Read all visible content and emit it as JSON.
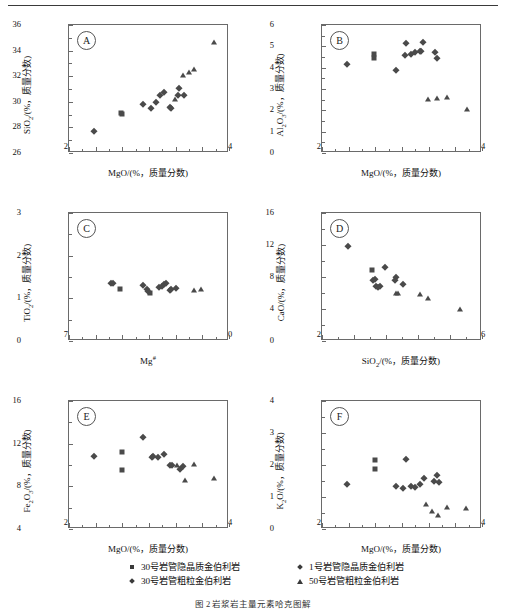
{
  "figure": {
    "caption": "图 2  岩浆岩主量元素哈克图解",
    "panels_order": [
      "A",
      "B",
      "C",
      "D",
      "E",
      "F"
    ]
  },
  "legend": {
    "items": [
      {
        "marker": "square",
        "label": "30号岩管隐晶质金伯利岩"
      },
      {
        "marker": "diamond",
        "label": "30号岩管粗粒金伯利岩"
      },
      {
        "marker": "diamond",
        "label": "1号岩管隐晶质金伯利岩"
      },
      {
        "marker": "triangle",
        "label": "50号岩管粗粒金伯利岩"
      }
    ]
  },
  "chart_data": [
    {
      "id": "A",
      "type": "scatter",
      "title": "A",
      "xlabel": "MgO/(%，质量分数)",
      "ylabel": "SiO2/(%，质量分数)",
      "xlim": [
        22,
        34
      ],
      "ylim": [
        26,
        36
      ],
      "xticks": [
        22,
        24,
        26,
        28,
        30,
        32,
        34
      ],
      "yticks": [
        26,
        28,
        30,
        32,
        34,
        36
      ],
      "grid": false,
      "series": [
        {
          "name": "30号岩管隐晶质金伯利岩",
          "marker": "square",
          "points": [
            [
              25.9,
              29.15
            ],
            [
              25.95,
              29.05
            ]
          ]
        },
        {
          "name": "30号岩管粗粒金伯利岩",
          "marker": "diamond",
          "points": [
            [
              23.9,
              27.75
            ],
            [
              27.55,
              29.85
            ],
            [
              28.15,
              29.55
            ],
            [
              28.5,
              29.95
            ],
            [
              28.8,
              30.5
            ],
            [
              29.1,
              30.8
            ],
            [
              29.6,
              29.6
            ],
            [
              29.65,
              29.5
            ],
            [
              30.2,
              30.55
            ],
            [
              30.25,
              31.05
            ],
            [
              30.65,
              30.5
            ]
          ]
        },
        {
          "name": "50号岩管粗粒金伯利岩",
          "marker": "triangle",
          "points": [
            [
              29.95,
              30.25
            ],
            [
              30.55,
              32.1
            ],
            [
              31.0,
              32.35
            ],
            [
              31.4,
              32.6
            ],
            [
              32.85,
              34.65
            ]
          ]
        }
      ]
    },
    {
      "id": "B",
      "type": "scatter",
      "title": "B",
      "xlabel": "MgO/(%，质量分数)",
      "ylabel": "Al2O3/(%，质量分数)",
      "xlim": [
        22,
        34
      ],
      "ylim": [
        0,
        6
      ],
      "xticks": [
        22,
        24,
        26,
        28,
        30,
        32,
        34
      ],
      "yticks": [
        0,
        1,
        2,
        3,
        4,
        5,
        6
      ],
      "grid": false,
      "series": [
        {
          "name": "30号岩管隐晶质金伯利岩",
          "marker": "square",
          "points": [
            [
              25.9,
              4.62
            ],
            [
              25.9,
              4.45
            ]
          ]
        },
        {
          "name": "30号岩管粗粒金伯利岩",
          "marker": "diamond",
          "points": [
            [
              23.9,
              4.18
            ],
            [
              27.55,
              3.9
            ],
            [
              28.2,
              4.6
            ],
            [
              28.3,
              5.15
            ],
            [
              28.65,
              4.65
            ],
            [
              29.0,
              4.72
            ],
            [
              29.35,
              4.8
            ],
            [
              29.45,
              4.78
            ],
            [
              29.6,
              5.2
            ],
            [
              30.5,
              4.75
            ],
            [
              30.6,
              4.45
            ]
          ]
        },
        {
          "name": "50号岩管粗粒金伯利岩",
          "marker": "triangle",
          "points": [
            [
              29.95,
              2.55
            ],
            [
              30.6,
              2.6
            ],
            [
              31.35,
              2.62
            ],
            [
              32.85,
              2.08
            ]
          ]
        }
      ]
    },
    {
      "id": "C",
      "type": "scatter",
      "title": "C",
      "xlabel": "Mg#",
      "ylabel": "TiO2/(%，质量分数)",
      "xlim": [
        78,
        90
      ],
      "ylim": [
        0,
        3
      ],
      "xticks": [
        78,
        80,
        82,
        84,
        86,
        88,
        90
      ],
      "yticks": [
        0,
        1,
        2,
        3
      ],
      "grid": false,
      "series": [
        {
          "name": "30号岩管隐晶质金伯利岩",
          "marker": "square",
          "points": [
            [
              81.85,
              1.22
            ],
            [
              84.05,
              1.12
            ]
          ]
        },
        {
          "name": "30号岩管粗粒金伯利岩",
          "marker": "diamond",
          "points": [
            [
              81.15,
              1.35
            ],
            [
              81.3,
              1.35
            ],
            [
              83.55,
              1.32
            ],
            [
              83.85,
              1.22
            ],
            [
              83.95,
              1.18
            ],
            [
              84.75,
              1.26
            ],
            [
              85.0,
              1.3
            ],
            [
              85.15,
              1.33
            ],
            [
              85.25,
              1.36
            ],
            [
              85.6,
              1.2
            ],
            [
              85.65,
              1.22
            ],
            [
              86.0,
              1.25
            ]
          ]
        },
        {
          "name": "50号岩管粗粒金伯利岩",
          "marker": "triangle",
          "points": [
            [
              87.35,
              1.2
            ],
            [
              87.9,
              1.23
            ]
          ]
        }
      ]
    },
    {
      "id": "D",
      "type": "scatter",
      "title": "D",
      "xlabel": "SiO2/(%，质量分数)",
      "ylabel": "CaO/(%，质量分数)",
      "xlim": [
        26,
        36
      ],
      "ylim": [
        0,
        16
      ],
      "xticks": [
        26,
        28,
        30,
        32,
        34,
        36
      ],
      "yticks": [
        0,
        4,
        8,
        12,
        16
      ],
      "grid": false,
      "series": [
        {
          "name": "30号岩管隐晶质金伯利岩",
          "marker": "square",
          "points": [
            [
              29.1,
              8.9
            ]
          ]
        },
        {
          "name": "30号岩管粗粒金伯利岩",
          "marker": "diamond",
          "points": [
            [
              27.6,
              11.85
            ],
            [
              29.2,
              7.6
            ],
            [
              29.3,
              7.8
            ],
            [
              29.4,
              6.9
            ],
            [
              29.5,
              6.8
            ],
            [
              29.65,
              6.85
            ],
            [
              29.95,
              9.3
            ],
            [
              30.55,
              7.6
            ],
            [
              30.6,
              7.95
            ],
            [
              31.05,
              7.15
            ]
          ]
        },
        {
          "name": "50号岩管粗粒金伯利岩",
          "marker": "triangle",
          "points": [
            [
              30.6,
              6.05
            ],
            [
              30.75,
              6.05
            ],
            [
              32.1,
              5.85
            ],
            [
              32.6,
              5.4
            ],
            [
              34.65,
              3.95
            ]
          ]
        }
      ]
    },
    {
      "id": "E",
      "type": "scatter",
      "title": "E",
      "xlabel": "MgO/(%，质量分数)",
      "ylabel": "Fe2O3/(%，质量分数)",
      "xlim": [
        22,
        34
      ],
      "ylim": [
        4,
        16
      ],
      "xticks": [
        22,
        24,
        26,
        28,
        30,
        32,
        34
      ],
      "yticks": [
        4,
        8,
        12,
        16
      ],
      "grid": false,
      "series": [
        {
          "name": "30号岩管隐晶质金伯利岩",
          "marker": "square",
          "points": [
            [
              25.95,
              11.2
            ],
            [
              25.95,
              9.5
            ]
          ]
        },
        {
          "name": "30号岩管粗粒金伯利岩",
          "marker": "diamond",
          "points": [
            [
              23.9,
              10.8
            ],
            [
              27.55,
              12.6
            ],
            [
              28.2,
              10.75
            ],
            [
              28.3,
              10.8
            ],
            [
              28.65,
              10.75
            ],
            [
              29.1,
              11.0
            ],
            [
              29.6,
              10.0
            ],
            [
              29.75,
              10.0
            ],
            [
              30.3,
              9.6
            ],
            [
              30.55,
              9.9
            ]
          ]
        },
        {
          "name": "50号岩管粗粒金伯利岩",
          "marker": "triangle",
          "points": [
            [
              30.1,
              10.0
            ],
            [
              30.7,
              8.6
            ],
            [
              31.4,
              10.05
            ],
            [
              32.85,
              8.75
            ]
          ]
        }
      ]
    },
    {
      "id": "F",
      "type": "scatter",
      "title": "F",
      "xlabel": "MgO/(%，质量分数)",
      "ylabel": "K2O/(%，质量分数)",
      "xlim": [
        22,
        34
      ],
      "ylim": [
        0,
        4
      ],
      "xticks": [
        22,
        24,
        26,
        28,
        30,
        32,
        34
      ],
      "yticks": [
        0,
        1,
        2,
        3,
        4
      ],
      "grid": false,
      "series": [
        {
          "name": "30号岩管隐晶质金伯利岩",
          "marker": "square",
          "points": [
            [
              25.95,
              2.15
            ],
            [
              25.95,
              1.88
            ]
          ]
        },
        {
          "name": "30号岩管粗粒金伯利岩",
          "marker": "diamond",
          "points": [
            [
              23.9,
              1.4
            ],
            [
              27.55,
              1.35
            ],
            [
              28.1,
              1.28
            ],
            [
              28.3,
              2.2
            ],
            [
              28.65,
              1.35
            ],
            [
              28.95,
              1.32
            ],
            [
              29.35,
              1.4
            ],
            [
              29.65,
              1.6
            ],
            [
              30.4,
              1.5
            ],
            [
              30.6,
              1.68
            ],
            [
              30.75,
              1.48
            ]
          ]
        },
        {
          "name": "50号岩管粗粒金伯利岩",
          "marker": "triangle",
          "points": [
            [
              29.8,
              0.78
            ],
            [
              30.25,
              0.55
            ],
            [
              30.7,
              0.45
            ],
            [
              31.4,
              0.7
            ],
            [
              32.8,
              0.65
            ]
          ]
        }
      ]
    }
  ]
}
